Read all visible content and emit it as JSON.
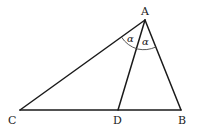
{
  "diagram": {
    "points": {
      "A": {
        "label": "A",
        "x": 145,
        "y": 20
      },
      "B": {
        "label": "B",
        "x": 181,
        "y": 110
      },
      "C": {
        "label": "C",
        "x": 20,
        "y": 110
      },
      "D": {
        "label": "D",
        "x": 118,
        "y": 110
      }
    },
    "segments": [
      "AB",
      "AC",
      "CB",
      "AD"
    ],
    "angles": [
      {
        "vertex": "A",
        "between": [
          "AC",
          "AD"
        ],
        "label": "α"
      },
      {
        "vertex": "A",
        "between": [
          "AD",
          "AB"
        ],
        "label": "α"
      }
    ]
  }
}
